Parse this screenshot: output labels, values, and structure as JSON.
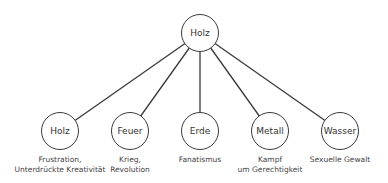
{
  "root": {
    "label": "Holz",
    "cx": 200,
    "cy": 33
  },
  "children": [
    {
      "label": "Holz",
      "cx": 60,
      "cy": 131,
      "description": "Frustration,\nUnterdrückte Kreativität"
    },
    {
      "label": "Feuer",
      "cx": 130,
      "cy": 131,
      "description": "Krieg,\nRevolution"
    },
    {
      "label": "Erde",
      "cx": 200,
      "cy": 131,
      "description": "Fanatismus"
    },
    {
      "label": "Metall",
      "cx": 270,
      "cy": 131,
      "description": "Kampf\num Gerechtigkeit"
    },
    {
      "label": "Wasser",
      "cx": 340,
      "cy": 131,
      "description": "Sexuelle Gewalt"
    }
  ],
  "colors": {
    "stroke": "#3a3a3a",
    "text": "#333333",
    "background": "#ffffff"
  }
}
